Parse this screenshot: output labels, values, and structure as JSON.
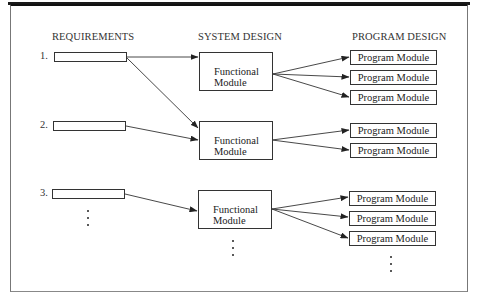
{
  "headers": {
    "requirements": "REQUIREMENTS",
    "system_design": "SYSTEM DESIGN",
    "program_design": "PROGRAM DESIGN"
  },
  "requirements": [
    {
      "number": "1."
    },
    {
      "number": "2."
    },
    {
      "number": "3."
    }
  ],
  "functional_modules": [
    {
      "line1": "Functional",
      "line2": "Module"
    },
    {
      "line1": "Functional",
      "line2": "Module"
    },
    {
      "line1": "Functional",
      "line2": "Module"
    }
  ],
  "program_modules": [
    {
      "label": "Program Module",
      "group": 1
    },
    {
      "label": "Program Module",
      "group": 1
    },
    {
      "label": "Program Module",
      "group": 1
    },
    {
      "label": "Program Module",
      "group": 2
    },
    {
      "label": "Program Module",
      "group": 2
    },
    {
      "label": "Program Module",
      "group": 3
    },
    {
      "label": "Program Module",
      "group": 3
    },
    {
      "label": "Program Module",
      "group": 3
    }
  ],
  "connections": [
    {
      "from": "requirement-1",
      "to": "functional-module-1"
    },
    {
      "from": "requirement-1",
      "to": "functional-module-2"
    },
    {
      "from": "requirement-2",
      "to": "functional-module-2"
    },
    {
      "from": "requirement-3",
      "to": "functional-module-3"
    },
    {
      "from": "functional-module-1",
      "to": "program-module-1"
    },
    {
      "from": "functional-module-1",
      "to": "program-module-2"
    },
    {
      "from": "functional-module-1",
      "to": "program-module-3"
    },
    {
      "from": "functional-module-2",
      "to": "program-module-4"
    },
    {
      "from": "functional-module-2",
      "to": "program-module-5"
    },
    {
      "from": "functional-module-3",
      "to": "program-module-6"
    },
    {
      "from": "functional-module-3",
      "to": "program-module-7"
    },
    {
      "from": "functional-module-3",
      "to": "program-module-8"
    }
  ],
  "continuation_marker": "ellipsis-vertical"
}
